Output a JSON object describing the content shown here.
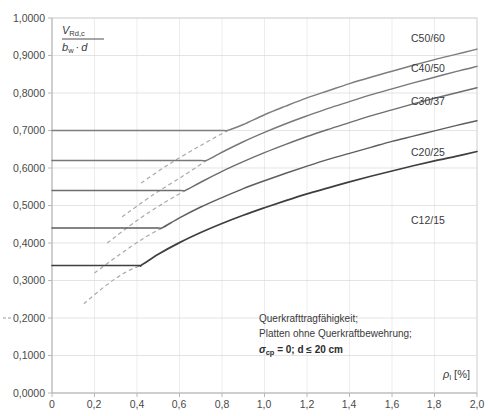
{
  "chart_data": {
    "type": "line",
    "title": "",
    "xlabel": "ρ_l [%]",
    "ylabel": "V_Rd,c / (b_w · d)",
    "xlim": [
      0,
      2.0
    ],
    "ylim": [
      0,
      1.0
    ],
    "grid": true,
    "legend_position": "inline-right",
    "x_ticks": [
      "0",
      "0,2",
      "0,4",
      "0,6",
      "0,8",
      "1,0",
      "1,2",
      "1,4",
      "1,6",
      "1,8",
      "2,0"
    ],
    "x_tick_values": [
      0,
      0.2,
      0.4,
      0.6,
      0.8,
      1.0,
      1.2,
      1.4,
      1.6,
      1.8,
      2.0
    ],
    "y_ticks": [
      "0,0000",
      "0,1000",
      "0,2000",
      "0,3000",
      "0,4000",
      "0,5000",
      "0,6000",
      "0,7000",
      "0,8000",
      "0,9000",
      "1,0000"
    ],
    "y_tick_values": [
      0,
      0.1,
      0.2,
      0.3,
      0.4,
      0.5,
      0.6,
      0.7,
      0.8,
      0.9,
      1.0
    ],
    "series": [
      {
        "name": "C50/60",
        "plateau_value": 0.7,
        "kink_x": 0.83,
        "end_value": 0.92,
        "x": [
          0.0,
          0.2,
          0.4,
          0.6,
          0.8,
          0.83,
          0.9,
          1.0,
          1.1,
          1.2,
          1.3,
          1.4,
          1.5,
          1.6,
          1.7,
          1.8,
          1.9,
          2.0
        ],
        "y": [
          0.7,
          0.7,
          0.7,
          0.7,
          0.7,
          0.701,
          0.716,
          0.742,
          0.765,
          0.787,
          0.806,
          0.825,
          0.842,
          0.858,
          0.874,
          0.889,
          0.903,
          0.917
        ],
        "dashed_x": [
          0.42,
          0.55,
          0.7,
          0.83
        ],
        "dashed_y": [
          0.56,
          0.61,
          0.66,
          0.701
        ]
      },
      {
        "name": "C40/50",
        "plateau_value": 0.62,
        "kink_x": 0.73,
        "end_value": 0.86,
        "x": [
          0.0,
          0.2,
          0.4,
          0.6,
          0.7,
          0.73,
          0.8,
          0.9,
          1.0,
          1.1,
          1.2,
          1.3,
          1.4,
          1.5,
          1.6,
          1.7,
          1.8,
          1.9,
          2.0
        ],
        "y": [
          0.62,
          0.62,
          0.62,
          0.62,
          0.62,
          0.621,
          0.642,
          0.67,
          0.695,
          0.718,
          0.739,
          0.759,
          0.777,
          0.795,
          0.811,
          0.827,
          0.842,
          0.857,
          0.871
        ],
        "dashed_x": [
          0.33,
          0.48,
          0.62,
          0.73
        ],
        "dashed_y": [
          0.47,
          0.53,
          0.58,
          0.621
        ]
      },
      {
        "name": "C30/37",
        "plateau_value": 0.54,
        "kink_x": 0.63,
        "end_value": 0.78,
        "x": [
          0.0,
          0.2,
          0.4,
          0.6,
          0.63,
          0.7,
          0.8,
          0.9,
          1.0,
          1.1,
          1.2,
          1.3,
          1.4,
          1.5,
          1.6,
          1.7,
          1.8,
          1.9,
          2.0
        ],
        "y": [
          0.54,
          0.54,
          0.54,
          0.54,
          0.541,
          0.562,
          0.591,
          0.617,
          0.641,
          0.663,
          0.684,
          0.703,
          0.721,
          0.739,
          0.755,
          0.771,
          0.786,
          0.8,
          0.814
        ],
        "dashed_x": [
          0.26,
          0.4,
          0.53,
          0.63
        ],
        "dashed_y": [
          0.4,
          0.46,
          0.508,
          0.541
        ]
      },
      {
        "name": "C20/25",
        "plateau_value": 0.44,
        "kink_x": 0.52,
        "end_value": 0.68,
        "x": [
          0.0,
          0.2,
          0.4,
          0.5,
          0.52,
          0.6,
          0.7,
          0.8,
          0.9,
          1.0,
          1.1,
          1.2,
          1.3,
          1.4,
          1.5,
          1.6,
          1.7,
          1.8,
          1.9,
          2.0
        ],
        "y": [
          0.44,
          0.44,
          0.44,
          0.44,
          0.441,
          0.467,
          0.496,
          0.521,
          0.545,
          0.566,
          0.586,
          0.605,
          0.623,
          0.639,
          0.655,
          0.671,
          0.685,
          0.699,
          0.713,
          0.726
        ],
        "dashed_x": [
          0.2,
          0.32,
          0.43,
          0.52
        ],
        "dashed_y": [
          0.32,
          0.37,
          0.412,
          0.441
        ]
      },
      {
        "name": "C12/15",
        "plateau_value": 0.34,
        "kink_x": 0.42,
        "end_value": 0.57,
        "x": [
          0.0,
          0.2,
          0.4,
          0.42,
          0.5,
          0.6,
          0.7,
          0.8,
          0.9,
          1.0,
          1.1,
          1.2,
          1.3,
          1.4,
          1.5,
          1.6,
          1.7,
          1.8,
          1.9,
          2.0
        ],
        "y": [
          0.34,
          0.34,
          0.34,
          0.341,
          0.37,
          0.401,
          0.428,
          0.452,
          0.474,
          0.494,
          0.513,
          0.531,
          0.547,
          0.563,
          0.578,
          0.592,
          0.606,
          0.619,
          0.631,
          0.644
        ],
        "dashed_x": [
          0.15,
          0.25,
          0.34,
          0.42
        ],
        "dashed_y": [
          0.238,
          0.285,
          0.32,
          0.341
        ]
      }
    ],
    "annotations": [
      "Querkrafttragfähigkeit;",
      "Platten ohne Querkraftbewehrung;"
    ],
    "annotation_bold": "σcp = 0; d ≤ 20 cm",
    "colors": {
      "axis": "#b8b8b8",
      "grid": "#d8d8d8",
      "curve_light": "#7a7a7a",
      "curve_dark": "#4a4a4a",
      "dashed": "#a9a9a9",
      "text": "#3a3a3a"
    }
  },
  "axis": {
    "y_label_numerator": "V",
    "y_label_numerator_sub": "Rd,c",
    "y_label_denominator_b": "b",
    "y_label_denominator_b_sub": "w",
    "y_label_denominator_dot": "·",
    "y_label_denominator_d": "d",
    "x_label_rho": "ρ",
    "x_label_rho_sub": "l",
    "x_label_unit": "[%]"
  },
  "notes": {
    "line1": "Querkrafttragfähigkeit;",
    "line2": "Platten ohne Querkraftbewehrung;",
    "line3_sigma": "σ",
    "line3_sub": "cp",
    "line3_rest": " = 0; d ≤ 20 cm"
  },
  "curve_labels": {
    "c50": "C50/60",
    "c40": "C40/50",
    "c30": "C30/37",
    "c20": "C20/25",
    "c12": "C12/15"
  },
  "y_tick_labels": {
    "t10": "1,0000",
    "t09": "0,9000",
    "t08": "0,8000",
    "t07": "0,7000",
    "t06": "0,6000",
    "t05": "0,5000",
    "t04": "0,4000",
    "t03": "0,3000",
    "t02": "0,2000",
    "t01": "0,1000",
    "t00": "0,0000"
  },
  "x_tick_labels": {
    "x0": "0",
    "x02": "0,2",
    "x04": "0,4",
    "x06": "0,6",
    "x08": "0,8",
    "x10": "1,0",
    "x12": "1,2",
    "x14": "1,4",
    "x16": "1,6",
    "x18": "1,8",
    "x20": "2,0"
  }
}
